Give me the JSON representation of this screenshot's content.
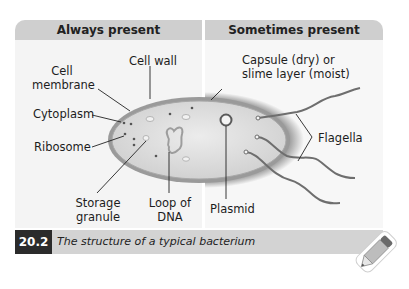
{
  "figure": {
    "number": "20.2",
    "caption": "The structure of a typical bacterium"
  },
  "panels": {
    "left": {
      "header": "Always present"
    },
    "right": {
      "header": "Sometimes present"
    }
  },
  "labels": {
    "cell_wall": "Cell wall",
    "cell_membrane_1": "Cell",
    "cell_membrane_2": "membrane",
    "cytoplasm": "Cytoplasm",
    "ribosome": "Ribosome",
    "storage_granule_1": "Storage",
    "storage_granule_2": "granule",
    "loop_dna_1": "Loop of",
    "loop_dna_2": "DNA",
    "capsule_1": "Capsule (dry) or",
    "capsule_2": "slime layer (moist)",
    "flagella": "Flagella",
    "plasmid": "Plasmid"
  },
  "icons": {
    "pencil": "pencil-icon"
  },
  "colors": {
    "header_bg": "#cfcfcf",
    "panel_bg": "#f4f4f4",
    "caption_bg": "#d3d3d3",
    "caption_num_bg": "#2b2b2b",
    "cell_wall": "#8c8c8c",
    "cytoplasm": "#d9d9d9"
  }
}
